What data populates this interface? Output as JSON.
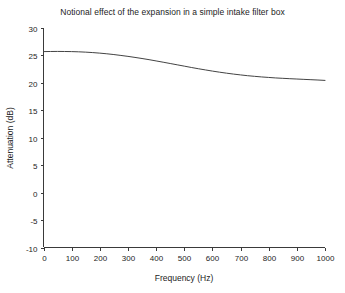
{
  "chart_data": {
    "type": "line",
    "title": "Notional effect of the expansion in a simple intake filter box",
    "xlabel": "Frequency (Hz)",
    "ylabel": "Attenuation (dB)",
    "xlim": [
      0,
      1000
    ],
    "ylim": [
      -10,
      30
    ],
    "xticks": [
      0,
      100,
      200,
      300,
      400,
      500,
      600,
      700,
      800,
      900,
      1000
    ],
    "xticklabels": [
      "0",
      "100",
      "200",
      "300",
      "400",
      "500",
      "600",
      "700",
      "800",
      "900",
      "1000"
    ],
    "yticks": [
      -10,
      -5,
      0,
      5,
      10,
      15,
      20,
      25,
      30
    ],
    "yticklabels": [
      "-10",
      "-5",
      "0",
      "5",
      "10",
      "15",
      "20",
      "25",
      "30"
    ],
    "grid": false,
    "legend": false,
    "line_color": "#434343",
    "line_width": 1,
    "x": [
      0,
      25,
      50,
      75,
      100,
      125,
      150,
      175,
      200,
      225,
      250,
      275,
      300,
      325,
      350,
      375,
      400,
      425,
      450,
      475,
      500,
      525,
      550,
      575,
      600,
      625,
      650,
      675,
      700,
      725,
      750,
      775,
      800,
      825,
      850,
      875,
      900,
      925,
      950,
      975,
      1000
    ],
    "y": [
      25.7,
      25.72,
      25.73,
      25.72,
      25.7,
      25.66,
      25.6,
      25.52,
      25.42,
      25.3,
      25.16,
      25.0,
      24.83,
      24.64,
      24.44,
      24.23,
      24.0,
      23.77,
      23.53,
      23.29,
      23.05,
      22.81,
      22.58,
      22.36,
      22.15,
      21.95,
      21.77,
      21.6,
      21.45,
      21.31,
      21.19,
      21.08,
      20.99,
      20.9,
      20.83,
      20.76,
      20.7,
      20.64,
      20.58,
      20.52,
      20.45
    ]
  }
}
